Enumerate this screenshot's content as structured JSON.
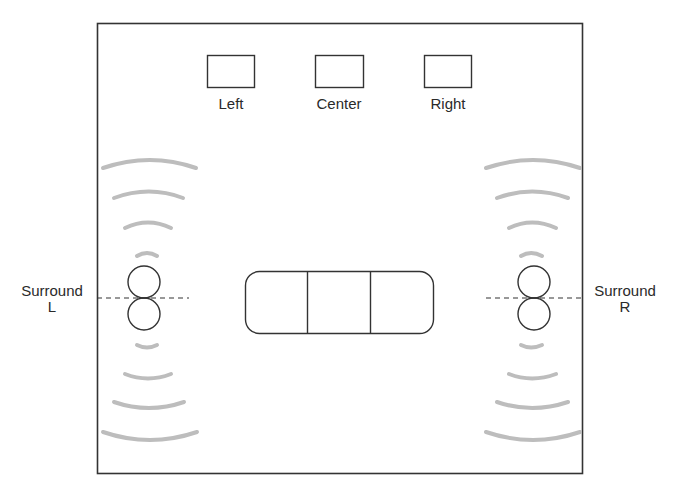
{
  "diagram": {
    "type": "surround-sound-speaker-layout",
    "colors": {
      "outline": "#333333",
      "wave": "#bdbdbd",
      "background": "#ffffff",
      "text": "#2a2a2a"
    },
    "room": {
      "x": 97,
      "y": 23,
      "width": 485,
      "height": 450
    },
    "front_speakers": [
      {
        "id": "left",
        "label": "Left",
        "x": 207,
        "y": 55,
        "width": 47,
        "height": 32
      },
      {
        "id": "center",
        "label": "Center",
        "x": 315,
        "y": 55,
        "width": 48,
        "height": 32
      },
      {
        "id": "right",
        "label": "Right",
        "x": 424,
        "y": 55,
        "width": 47,
        "height": 32
      }
    ],
    "surround_speakers": [
      {
        "id": "surround-left",
        "label_line1": "Surround",
        "label_line2": "L",
        "cx": 144,
        "cy_top": 282,
        "cy_bottom": 314,
        "r": 16
      },
      {
        "id": "surround-right",
        "label_line1": "Surround",
        "label_line2": "R",
        "cx": 534,
        "cy_top": 282,
        "cy_bottom": 314,
        "r": 16
      }
    ],
    "couch": {
      "x": 245,
      "y": 271,
      "width": 188,
      "height": 62,
      "corner_radius": 14,
      "seat_count": 3
    }
  }
}
